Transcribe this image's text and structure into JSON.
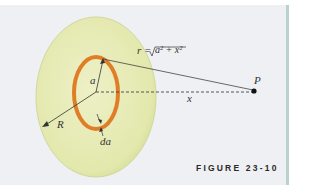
{
  "figure": {
    "caption": "FIGURE 23-10",
    "labels": {
      "r_equation_lhs": "r =",
      "r_equation_rhs": "a² + x²",
      "a": "a",
      "R": "R",
      "da": "da",
      "x": "x",
      "P": "P"
    },
    "colors": {
      "background": "#eef0f3",
      "disk_fill": "#e8ecb8",
      "ring": "#e07e28",
      "border": "#b9d3cc"
    }
  }
}
